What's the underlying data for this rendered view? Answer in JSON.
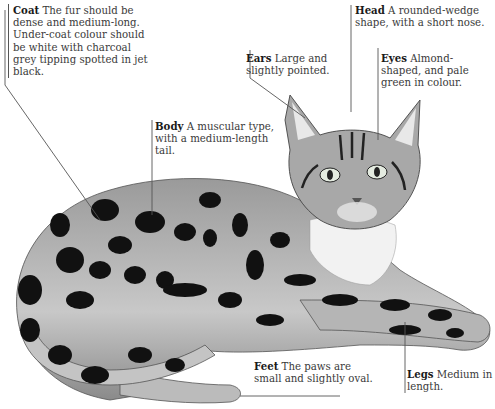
{
  "diagram": {
    "labels": [
      {
        "id": "coat",
        "title": "Coat",
        "text": "The fur should be dense and medium-long. Under-coat colour should be white with charcoal grey tipping spotted in jet black."
      },
      {
        "id": "head",
        "title": "Head",
        "text": "A rounded-wedge shape, with a short nose."
      },
      {
        "id": "ears",
        "title": "Ears",
        "text": "Large and slightly pointed."
      },
      {
        "id": "eyes",
        "title": "Eyes",
        "text": "Almond-shaped, and pale green in colour."
      },
      {
        "id": "body",
        "title": "Body",
        "text": "A muscular type, with a medium-length tail."
      },
      {
        "id": "feet",
        "title": "Feet",
        "text": "The paws are small and slightly oval."
      },
      {
        "id": "legs",
        "title": "Legs",
        "text": "Medium in length."
      }
    ]
  }
}
